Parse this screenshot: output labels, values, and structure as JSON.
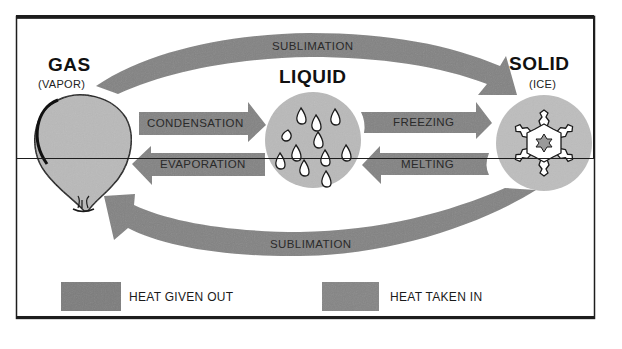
{
  "states": {
    "gas": {
      "title": "GAS",
      "subtitle": "(VAPOR)"
    },
    "liquid": {
      "title": "LIQUID"
    },
    "solid": {
      "title": "SOLID",
      "subtitle": "(ICE)"
    }
  },
  "transitions": {
    "sublimation_top": {
      "label": "SUBLIMATION",
      "from": "GAS",
      "to": "SOLID"
    },
    "condensation": {
      "label": "CONDENSATION",
      "from": "GAS",
      "to": "LIQUID"
    },
    "evaporation": {
      "label": "EVAPORATION",
      "from": "LIQUID",
      "to": "GAS"
    },
    "freezing": {
      "label": "FREEZING",
      "from": "LIQUID",
      "to": "SOLID"
    },
    "melting": {
      "label": "MELTING",
      "from": "SOLID",
      "to": "LIQUID"
    },
    "sublimation_bottom": {
      "label": "SUBLIMATION",
      "from": "SOLID",
      "to": "GAS"
    }
  },
  "legend": {
    "heat_given_out": {
      "label": "HEAT GIVEN OUT",
      "color": "#7d7d7d"
    },
    "heat_taken_in": {
      "label": "HEAT TAKEN IN",
      "color": "#858585"
    }
  },
  "colors": {
    "arrow": "#838383",
    "circle": "#b9b9b9",
    "outline": "#1a1a1a",
    "background": "#ffffff"
  }
}
